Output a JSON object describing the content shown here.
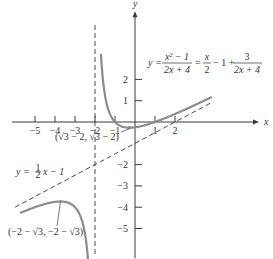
{
  "chart_data": {
    "type": "line",
    "title": "",
    "xlabel": "x",
    "ylabel": "y",
    "xlim": [
      -6.3,
      6.2
    ],
    "ylim": [
      -6.4,
      5.2
    ],
    "grid": false,
    "x_ticks": [
      {
        "value": -5,
        "label": "−5"
      },
      {
        "value": -4,
        "label": "−4"
      },
      {
        "value": -3,
        "label": "−3"
      },
      {
        "value": -2,
        "label": "−2"
      },
      {
        "value": -1,
        "label": "−1"
      },
      {
        "value": 1,
        "label": "1"
      },
      {
        "value": 2,
        "label": "2"
      }
    ],
    "y_ticks": [
      {
        "value": 2,
        "label": "2"
      },
      {
        "value": 1,
        "label": "1"
      },
      {
        "value": -2,
        "label": "−2"
      },
      {
        "value": -3,
        "label": "−3"
      },
      {
        "value": -4,
        "label": "−4"
      },
      {
        "value": -5,
        "label": "−5"
      }
    ],
    "series": [
      {
        "name": "y = (x^2 - 1)/(2x + 4)",
        "function": "rational",
        "branches": [
          [
            -1.7,
            3.8
          ],
          [
            -5.7,
            -2.35
          ]
        ]
      },
      {
        "name": "y = x/2 - 1",
        "style": "dashed",
        "domain": [
          -6.0,
          3.8
        ]
      },
      {
        "name": "x = -2",
        "style": "dashed",
        "vertical": -2
      }
    ],
    "annotations": {
      "equation": {
        "lhs": "y =",
        "frac1_num": "x² − 1",
        "frac1_den": "2x + 4",
        "eq2": "=",
        "frac2_num": "x",
        "frac2_den": "2",
        "mid": "− 1 +",
        "frac3_num": "3",
        "frac3_den": "2x + 4"
      },
      "asymptote_label": {
        "lhs": "y =",
        "frac_num": "1",
        "frac_den": "2",
        "rhs": "x − 1"
      },
      "local_min": {
        "label": "(√3 − 2,  √3 − 2)",
        "x": -0.268,
        "y": -0.268
      },
      "local_max": {
        "label": "(−2 − √3, −2 − √3)",
        "x": -3.732,
        "y": -3.732
      }
    }
  }
}
